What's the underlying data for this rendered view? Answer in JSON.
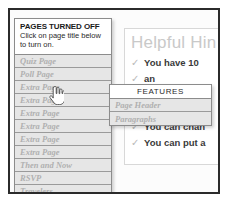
{
  "pages_panel": {
    "title": "PAGES TURNED OFF",
    "subtitle": "Click on page title below to turn on.",
    "items": [
      {
        "label": "Quiz Page"
      },
      {
        "label": "Poll Page"
      },
      {
        "label": "Extra Page"
      },
      {
        "label": "Extra Page"
      },
      {
        "label": "Extra Page"
      },
      {
        "label": "Extra Page"
      },
      {
        "label": "Extra Page"
      },
      {
        "label": "Extra Page"
      },
      {
        "label": "Then and Now"
      },
      {
        "label": "RSVP"
      },
      {
        "label": "Travelers"
      }
    ]
  },
  "features_panel": {
    "title": "FEATURES",
    "items": [
      {
        "label": "Page Header"
      },
      {
        "label": "Paragraphs"
      }
    ]
  },
  "hints_card": {
    "title": "Helpful Hin",
    "checkmark": "✓",
    "hints": [
      {
        "text": "You have 10"
      },
      {
        "text": "an"
      },
      {
        "text": "n"
      },
      {
        "text": "Every page h"
      },
      {
        "text": "You can chan"
      },
      {
        "text": "You can put a"
      }
    ]
  },
  "cursor": {
    "type": "pointing-hand"
  },
  "colors": {
    "frame_border": "#2b2b2b",
    "panel_background": "#e6e6e6",
    "panel_border": "#8c8c8c",
    "disabled_text": "#b0b0b0",
    "title_text": "#c9c9c9",
    "hint_text": "#3a3a3a"
  }
}
